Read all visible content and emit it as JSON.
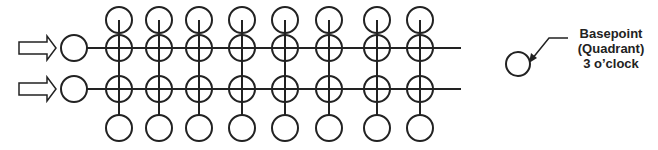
{
  "diagram": {
    "stroke_color": "#222222",
    "background": "#ffffff",
    "input_arrows": 2,
    "rows": [
      {
        "name": "row-1",
        "y": 48
      },
      {
        "name": "row-2",
        "y": 89
      }
    ],
    "columns_x": [
      119,
      159,
      199,
      242,
      285,
      329,
      377,
      420
    ],
    "top_circle_y": 20,
    "bottom_circle_y": 128,
    "circle_radius": 13,
    "inlet_circle_x": 74,
    "line_end_x": 461
  },
  "legend": {
    "icon": "circle-icon",
    "line1": "Basepoint",
    "line2": "(Quadrant)",
    "line3": "3 o’clock"
  }
}
